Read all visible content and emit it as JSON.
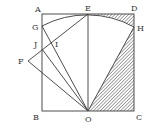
{
  "diagram": {
    "type": "geometry",
    "colors": {
      "stroke": "#3a3a3a",
      "hatch": "#3a3a3a",
      "background": "#ffffff"
    },
    "points": {
      "A": {
        "label": "A",
        "x": 42,
        "y": 14
      },
      "B": {
        "label": "B",
        "x": 42,
        "y": 111
      },
      "C": {
        "label": "C",
        "x": 134,
        "y": 111
      },
      "D": {
        "label": "D",
        "x": 134,
        "y": 14
      },
      "E": {
        "label": "E",
        "x": 88,
        "y": 14
      },
      "O": {
        "label": "O",
        "x": 88,
        "y": 111
      },
      "G": {
        "label": "G",
        "x": 42,
        "y": 26
      },
      "H": {
        "label": "H",
        "x": 134,
        "y": 27
      },
      "J": {
        "label": "J",
        "x": 42,
        "y": 49
      },
      "I": {
        "label": "I",
        "x": 53,
        "y": 43
      },
      "F": {
        "label": "F",
        "x": 28,
        "y": 61
      }
    },
    "segments": [
      "AB",
      "BC",
      "CD",
      "DA",
      "EO",
      "GO",
      "JO",
      "FO",
      "FE",
      "OH"
    ],
    "arc": {
      "center": "O",
      "from": "G",
      "to": "H",
      "through": "E"
    },
    "shaded": [
      "region E-D-H bounded by arc",
      "triangle O-C-H"
    ]
  }
}
